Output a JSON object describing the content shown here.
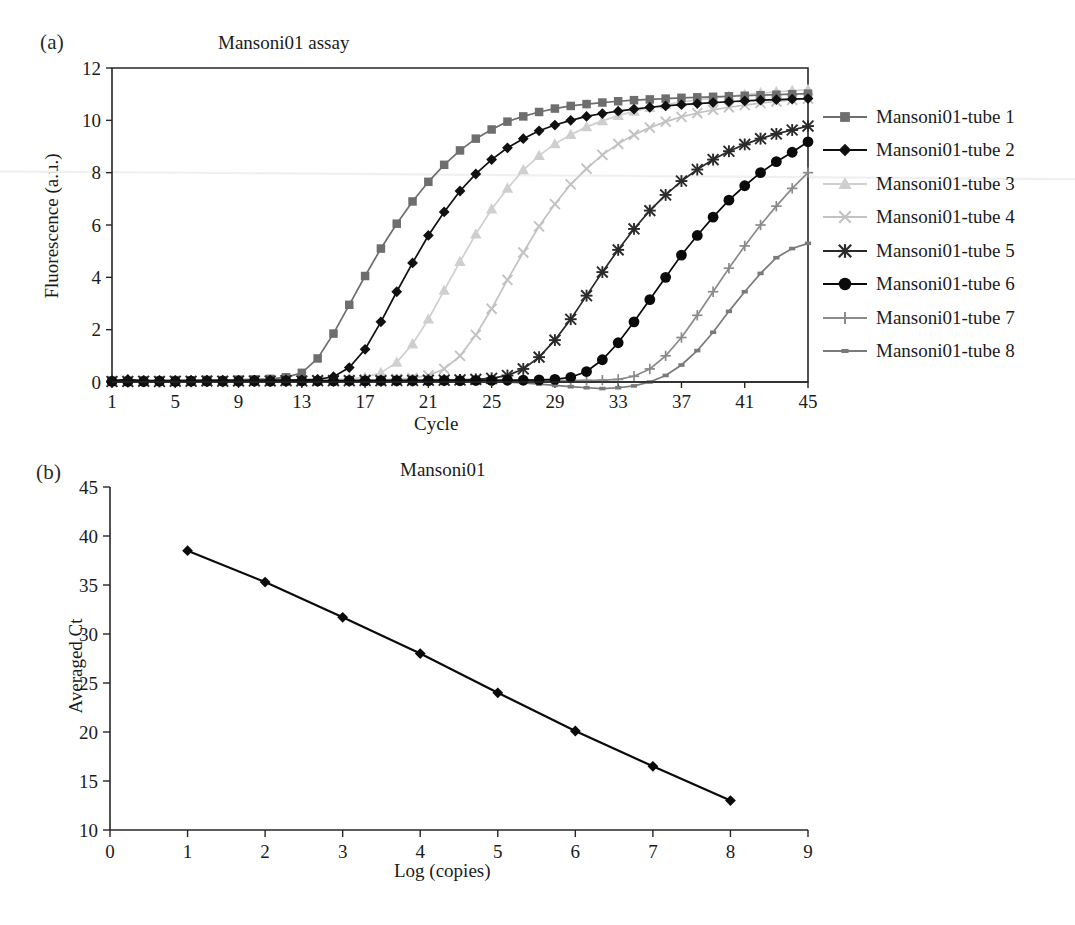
{
  "figure": {
    "panel_a_label": "(a)",
    "panel_b_label": "(b)"
  },
  "panel_a": {
    "title": "Mansoni01 assay",
    "xlabel": "Cycle",
    "ylabel": "Fluorescence (a.u.)",
    "xticks": [
      "1",
      "5",
      "9",
      "13",
      "17",
      "21",
      "25",
      "29",
      "33",
      "37",
      "41",
      "45"
    ],
    "yticks": [
      "0",
      "2",
      "4",
      "6",
      "8",
      "10",
      "12"
    ]
  },
  "panel_b": {
    "title": "Mansoni01",
    "xlabel": "Log (copies)",
    "ylabel": "Averaged Ct",
    "xticks": [
      "0",
      "1",
      "2",
      "3",
      "4",
      "5",
      "6",
      "7",
      "8",
      "9"
    ],
    "yticks": [
      "10",
      "15",
      "20",
      "25",
      "30",
      "35",
      "40",
      "45"
    ]
  },
  "legend": {
    "items": [
      {
        "label": "Mansoni01-tube 1",
        "marker": "square-marker",
        "color": "#6e6e6e"
      },
      {
        "label": "Mansoni01-tube 2",
        "marker": "diamond-marker",
        "color": "#101010"
      },
      {
        "label": "Mansoni01-tube 3",
        "marker": "triangle-marker",
        "color": "#cfcfcf"
      },
      {
        "label": "Mansoni01-tube 4",
        "marker": "x-marker",
        "color": "#c2c2c2"
      },
      {
        "label": "Mansoni01-tube 5",
        "marker": "asterisk-marker",
        "color": "#2a2a2a"
      },
      {
        "label": "Mansoni01-tube 6",
        "marker": "circle-marker",
        "color": "#0a0a0a"
      },
      {
        "label": "Mansoni01-tube 7",
        "marker": "plus-marker",
        "color": "#8a8a8a"
      },
      {
        "label": "Mansoni01-tube 8",
        "marker": "dash-marker",
        "color": "#7a7a7a"
      }
    ]
  },
  "chart_data": [
    {
      "type": "line",
      "panel": "(a)",
      "title": "Mansoni01 assay",
      "xlabel": "Cycle",
      "ylabel": "Fluorescence (a.u.)",
      "xlim": [
        1,
        45
      ],
      "ylim": [
        0,
        12
      ],
      "xticks": [
        1,
        5,
        9,
        13,
        17,
        21,
        25,
        29,
        33,
        37,
        41,
        45
      ],
      "yticks": [
        0,
        2,
        4,
        6,
        8,
        10,
        12
      ],
      "grid": false,
      "legend_position": "right-outside",
      "x": [
        1,
        2,
        3,
        4,
        5,
        6,
        7,
        8,
        9,
        10,
        11,
        12,
        13,
        14,
        15,
        16,
        17,
        18,
        19,
        20,
        21,
        22,
        23,
        24,
        25,
        26,
        27,
        28,
        29,
        30,
        31,
        32,
        33,
        34,
        35,
        36,
        37,
        38,
        39,
        40,
        41,
        42,
        43,
        44,
        45
      ],
      "series": [
        {
          "name": "Mansoni01-tube 1",
          "marker": "square",
          "color": "#6e6e6e",
          "ct": 13.0,
          "values": [
            0.05,
            0.04,
            0.06,
            0.05,
            0.07,
            0.06,
            0.08,
            0.07,
            0.09,
            0.1,
            0.12,
            0.18,
            0.35,
            0.9,
            1.85,
            2.95,
            4.05,
            5.1,
            6.05,
            6.9,
            7.65,
            8.3,
            8.85,
            9.3,
            9.65,
            9.95,
            10.15,
            10.32,
            10.45,
            10.55,
            10.62,
            10.68,
            10.73,
            10.77,
            10.8,
            10.83,
            10.86,
            10.88,
            10.9,
            10.92,
            10.94,
            10.96,
            10.98,
            11.0,
            11.02
          ]
        },
        {
          "name": "Mansoni01-tube 2",
          "marker": "diamond",
          "color": "#101010",
          "ct": 16.5,
          "values": [
            0.05,
            0.1,
            0.04,
            0.05,
            0.04,
            0.05,
            0.05,
            0.06,
            0.05,
            0.06,
            0.07,
            0.07,
            0.08,
            0.1,
            0.2,
            0.55,
            1.25,
            2.3,
            3.45,
            4.55,
            5.6,
            6.5,
            7.3,
            7.95,
            8.5,
            8.95,
            9.3,
            9.6,
            9.82,
            10.0,
            10.15,
            10.26,
            10.35,
            10.43,
            10.5,
            10.55,
            10.6,
            10.64,
            10.68,
            10.71,
            10.74,
            10.77,
            10.79,
            10.81,
            10.83
          ]
        },
        {
          "name": "Mansoni01-tube 3",
          "marker": "triangle",
          "color": "#cfcfcf",
          "ct": 20.0,
          "values": [
            0.03,
            0.03,
            0.04,
            0.04,
            0.05,
            0.04,
            0.05,
            0.05,
            0.06,
            0.05,
            0.06,
            0.06,
            0.07,
            0.08,
            0.09,
            0.12,
            0.18,
            0.35,
            0.75,
            1.45,
            2.4,
            3.5,
            4.6,
            5.65,
            6.6,
            7.4,
            8.1,
            8.65,
            9.1,
            9.45,
            9.75,
            9.98,
            10.18,
            10.34,
            10.48,
            10.6,
            10.7,
            10.78,
            10.85,
            10.92,
            10.98,
            11.04,
            11.09,
            11.13,
            11.17
          ]
        },
        {
          "name": "Mansoni01-tube 4",
          "marker": "x",
          "color": "#c2c2c2",
          "ct": 23.5,
          "values": [
            0.02,
            0.03,
            0.03,
            0.04,
            0.03,
            0.04,
            0.04,
            0.05,
            0.04,
            0.05,
            0.05,
            0.06,
            0.05,
            0.06,
            0.06,
            0.07,
            0.08,
            0.09,
            0.11,
            0.15,
            0.25,
            0.5,
            1.0,
            1.8,
            2.8,
            3.9,
            4.95,
            5.95,
            6.8,
            7.55,
            8.15,
            8.68,
            9.1,
            9.45,
            9.72,
            9.95,
            10.13,
            10.28,
            10.4,
            10.5,
            10.58,
            10.66,
            10.72,
            10.78,
            10.83
          ]
        },
        {
          "name": "Mansoni01-tube 5",
          "marker": "asterisk",
          "color": "#2a2a2a",
          "ct": 28.0,
          "values": [
            0.02,
            0.02,
            0.03,
            0.02,
            0.03,
            0.03,
            0.04,
            0.03,
            0.04,
            0.04,
            0.04,
            0.05,
            0.04,
            0.05,
            0.05,
            0.05,
            0.06,
            0.05,
            0.06,
            0.06,
            0.07,
            0.07,
            0.08,
            0.1,
            0.14,
            0.25,
            0.5,
            0.95,
            1.6,
            2.4,
            3.3,
            4.2,
            5.05,
            5.85,
            6.55,
            7.15,
            7.68,
            8.12,
            8.5,
            8.82,
            9.08,
            9.3,
            9.48,
            9.63,
            9.78
          ]
        },
        {
          "name": "Mansoni01-tube 6",
          "marker": "circle",
          "color": "#0a0a0a",
          "ct": 31.5,
          "values": [
            0.02,
            0.02,
            0.02,
            0.03,
            0.02,
            0.03,
            0.03,
            0.03,
            0.03,
            0.04,
            0.03,
            0.04,
            0.04,
            0.04,
            0.04,
            0.05,
            0.04,
            0.05,
            0.05,
            0.05,
            0.05,
            0.06,
            0.05,
            0.06,
            0.06,
            0.07,
            0.07,
            0.08,
            0.1,
            0.18,
            0.4,
            0.85,
            1.5,
            2.3,
            3.15,
            4.0,
            4.85,
            5.6,
            6.3,
            6.95,
            7.5,
            8.0,
            8.42,
            8.78,
            9.18
          ]
        },
        {
          "name": "Mansoni01-tube 7",
          "marker": "plus",
          "color": "#8a8a8a",
          "ct": 35.5,
          "values": [
            0.02,
            0.01,
            0.02,
            0.02,
            0.02,
            0.02,
            0.02,
            0.03,
            0.02,
            0.03,
            0.03,
            0.03,
            0.03,
            0.03,
            0.04,
            0.03,
            0.04,
            0.04,
            0.04,
            0.04,
            0.04,
            0.05,
            0.04,
            0.05,
            0.05,
            0.05,
            0.05,
            0.06,
            0.05,
            0.06,
            0.06,
            0.07,
            0.1,
            0.22,
            0.5,
            1.0,
            1.7,
            2.55,
            3.45,
            4.35,
            5.2,
            6.0,
            6.72,
            7.4,
            8.0
          ]
        },
        {
          "name": "Mansoni01-tube 8",
          "marker": "dash",
          "color": "#7a7a7a",
          "ct": 38.5,
          "values": [
            0.01,
            0.01,
            0.01,
            0.02,
            0.01,
            0.02,
            0.02,
            0.02,
            0.02,
            0.02,
            0.02,
            0.02,
            0.02,
            0.03,
            0.02,
            0.03,
            0.03,
            0.03,
            0.03,
            0.03,
            0.03,
            0.03,
            0.03,
            0.02,
            0.02,
            0.0,
            -0.03,
            -0.08,
            -0.13,
            -0.18,
            -0.22,
            -0.25,
            -0.22,
            -0.15,
            0.0,
            0.25,
            0.65,
            1.2,
            1.9,
            2.7,
            3.45,
            4.15,
            4.75,
            5.1,
            5.3
          ]
        }
      ]
    },
    {
      "type": "scatter",
      "panel": "(b)",
      "title": "Mansoni01",
      "xlabel": "Log (copies)",
      "ylabel": "Averaged Ct",
      "xlim": [
        0,
        9
      ],
      "ylim": [
        10,
        45
      ],
      "xticks": [
        0,
        1,
        2,
        3,
        4,
        5,
        6,
        7,
        8,
        9
      ],
      "yticks": [
        10,
        15,
        20,
        25,
        30,
        35,
        40,
        45
      ],
      "grid": false,
      "marker": "diamond",
      "color": "#0a0a0a",
      "fit_line": true,
      "x": [
        1,
        2,
        3,
        4,
        5,
        6,
        7,
        8
      ],
      "values": [
        38.5,
        35.3,
        31.7,
        28.0,
        24.0,
        20.1,
        16.5,
        13.0
      ]
    }
  ]
}
